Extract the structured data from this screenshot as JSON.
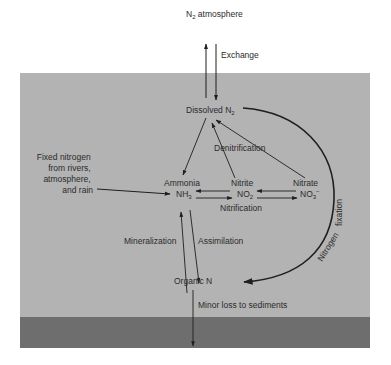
{
  "diagram": {
    "atmosphere_label": "N",
    "atmosphere_sub": "2",
    "atmosphere_suffix": " atmosphere",
    "exchange_label": "Exchange",
    "dissolved_label": "Dissolved N",
    "dissolved_sub": "2",
    "denitrification_label": "Denitrification",
    "fixed_nitrogen_lines": [
      "Fixed nitrogen",
      "from rivers,",
      "atmosphere,",
      "and rain"
    ],
    "ammonia_label": "Ammonia",
    "ammonia_formula": "NH",
    "ammonia_sub": "3",
    "nitrite_label": "Nitrite",
    "nitrite_formula": "NO",
    "nitrite_sub": "2",
    "nitrate_label": "Nitrate",
    "nitrate_formula": "NO",
    "nitrate_sub": "3",
    "nitrate_sup": "−",
    "nitrification_label": "Nitrification",
    "mineralization_label": "Mineralization",
    "assimilation_label": "Assimilation",
    "organic_label": "Organic N",
    "nitrogen_fixation_word1": "Nitrogen",
    "nitrogen_fixation_word2": "fixation",
    "sediment_loss_label": "Minor loss to sediments"
  },
  "colors": {
    "water": "#b3b3b3",
    "sediment": "#6e6e6e",
    "background": "#ffffff",
    "ink": "#1e1e1e"
  }
}
